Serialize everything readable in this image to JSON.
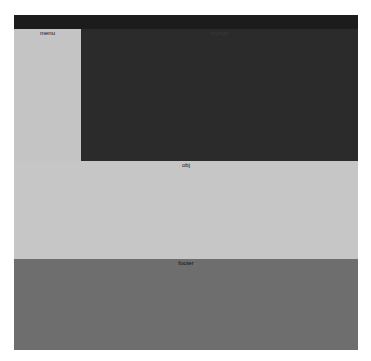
{
  "layout": {
    "topbar": {
      "label": ""
    },
    "menu": {
      "label": "menu"
    },
    "lounge": {
      "label": "lounge"
    },
    "obj": {
      "label": "obj"
    },
    "footer": {
      "label": "footer"
    }
  },
  "colors": {
    "topbar": "#1c1c1c",
    "menu": "#c4c4c4",
    "lounge": "#2b2b2b",
    "obj": "#c6c6c6",
    "footer": "#6e6e6e"
  }
}
